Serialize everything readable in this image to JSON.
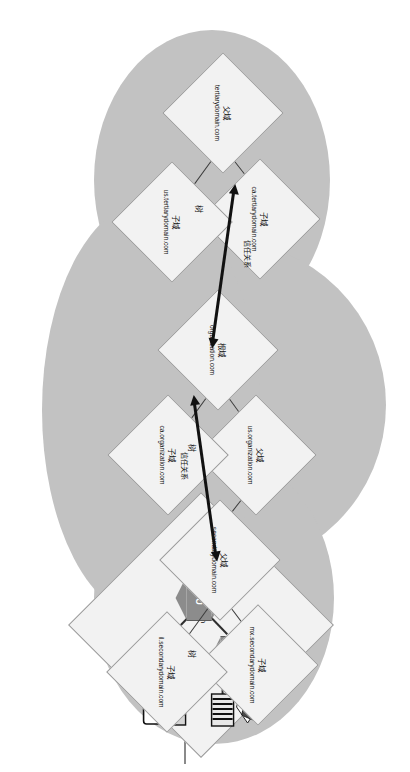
{
  "diagram": {
    "type": "ad-forest-domain-tree",
    "forest_label": "林",
    "tree_label": "树",
    "trust_label": "信任关系",
    "colors": {
      "forest_fill": "#c2c2c2",
      "node_fill": "#f2f2f2",
      "node_stroke": "#9a9a9a",
      "ou_fill": "#8c8c8c",
      "edge": "#3a3a3a",
      "arrow": "#111111",
      "page_bg": "#ffffff"
    }
  },
  "labels": {
    "root_domain": "根域",
    "parent_domain": "父域",
    "child_domain": "子域",
    "tree": "树",
    "forest": "林",
    "trust": "信任关系",
    "ou": "OU"
  },
  "trees": [
    {
      "name": "tertiarydomain-tree",
      "tree_marker": "树",
      "root": {
        "role_label": "父域",
        "fqdn": "tertiarydomain.com"
      },
      "children": [
        {
          "role_label": "子域",
          "fqdn": "ca.tertiarydomain.com"
        },
        {
          "role_label": "子域",
          "fqdn": "us.tertiarydomain.com"
        }
      ]
    },
    {
      "name": "organization-tree",
      "tree_marker": "树",
      "root": {
        "role_label": "根域",
        "fqdn": "organization.com"
      },
      "children": [
        {
          "role_label": "父域",
          "fqdn": "us.organization.com"
        },
        {
          "role_label": "子域",
          "fqdn": "ca.organization.com"
        }
      ],
      "grandchild": {
        "role_label": "子域",
        "fqdn": "other.us.organization.com",
        "ous": [
          {
            "label": "OU",
            "contains": [
              "user-icon",
              "server-rack-icon"
            ]
          },
          {
            "label": "OU",
            "contains": []
          },
          {
            "label": "OU",
            "contains": [
              "printer-icon",
              "workstation-icon"
            ]
          }
        ]
      }
    },
    {
      "name": "secondarydomain-tree",
      "tree_marker": "树",
      "root": {
        "role_label": "父域",
        "fqdn": "secondarydomain.com"
      },
      "children": [
        {
          "role_label": "子域",
          "fqdn": "mx.secondarydomain.com"
        },
        {
          "role_label": "子域",
          "fqdn": "il.secondarydomain.com"
        }
      ]
    }
  ],
  "trusts": [
    {
      "from": "organization.com",
      "to": "tertiarydomain.com",
      "label": "信任关系",
      "bidirectional": true
    },
    {
      "from": "organization.com",
      "to": "secondarydomain.com",
      "label": "信任关系",
      "bidirectional": true
    }
  ],
  "icons": [
    {
      "name": "user-icon",
      "glyph": "user"
    },
    {
      "name": "server-rack-icon",
      "glyph": "rack"
    },
    {
      "name": "printer-icon",
      "glyph": "printer"
    },
    {
      "name": "workstation-icon",
      "glyph": "monitor"
    }
  ]
}
